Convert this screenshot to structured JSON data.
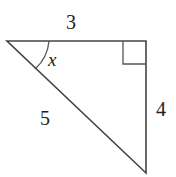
{
  "diagram": {
    "type": "right-triangle",
    "vertices": {
      "top_left": [
        7,
        41
      ],
      "right_angle": [
        146,
        41
      ],
      "bottom": [
        146,
        173
      ]
    },
    "sides": {
      "top": {
        "label": "3"
      },
      "right": {
        "label": "4"
      },
      "hypotenuse": {
        "label": "5"
      }
    },
    "angle": {
      "label": "x",
      "at": "top_left"
    },
    "right_angle_marker": {
      "at": "top_right",
      "size": 23
    },
    "colors": {
      "stroke": "#444444",
      "text": "#222222",
      "background": "#ffffff"
    }
  }
}
